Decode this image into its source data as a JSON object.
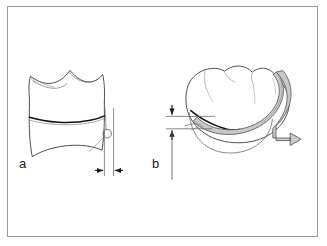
{
  "figure": {
    "domain_kind": "Diagram",
    "background_color": "#ffffff",
    "frame": {
      "border_color": "#9a9a9a",
      "border_width_px": 1,
      "x": 7,
      "y": 6,
      "width": 311,
      "height": 231
    },
    "line_color": "#3c3c3c",
    "dark_line_color": "#111111",
    "band_fill_color": "#c9c9c9",
    "band_stroke_color": "#5a5a5a",
    "dimension_color": "#1a1a1a"
  },
  "panels": [
    {
      "id": "a",
      "label": "a",
      "label_x": 19,
      "label_y": 157,
      "description": "Buccal view of a molar tooth showing the cervical margin line and a horizontal width dimension at the distal surface",
      "dimension": {
        "orientation": "horizontal",
        "arrow_style": "inward-pointing-pair",
        "value": ""
      }
    },
    {
      "id": "b",
      "label": "b",
      "label_x": 152,
      "label_y": 157,
      "description": "Occlusal-proximal view of a molar tooth with a shaded matrix band wrapping the crown and a vertical height dimension at the left",
      "dimension": {
        "orientation": "vertical",
        "arrow_style": "inward-pointing-pair",
        "value": ""
      }
    }
  ],
  "icons": {
    "arrow_left": "arrow-left-icon",
    "arrow_right": "arrow-right-icon",
    "arrow_down": "arrow-down-icon",
    "arrow_up": "arrow-up-icon"
  }
}
